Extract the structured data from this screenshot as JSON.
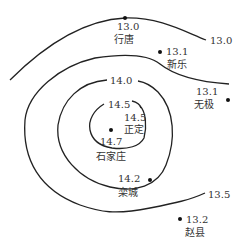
{
  "map": {
    "title": "",
    "isolines": [
      {
        "value": "13.0"
      },
      {
        "value": "13.5"
      },
      {
        "value": "14.0"
      },
      {
        "value": "14.5"
      }
    ],
    "isoline_labels": {
      "l130": "13.0",
      "l135": "13.5",
      "l140": "14.0",
      "l145": "14.5"
    },
    "stations": [
      {
        "name": "行唐",
        "value": "13.0"
      },
      {
        "name": "新乐",
        "value": "13.1"
      },
      {
        "name": "无极",
        "value": "13.1"
      },
      {
        "name": "正定",
        "value": "14.5"
      },
      {
        "name": "石家庄",
        "value": "14.7"
      },
      {
        "name": "栾城",
        "value": "14.2"
      },
      {
        "name": "赵县",
        "value": "13.2"
      }
    ]
  }
}
